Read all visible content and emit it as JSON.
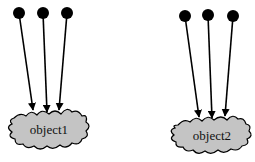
{
  "diagram": {
    "colors": {
      "background": "#ffffff",
      "stroke": "#000000",
      "cloud_fill": "#c4c4c4"
    },
    "groups": [
      {
        "name": "group-1",
        "object_label": "object1",
        "sources": [
          {
            "cx": 19,
            "cy": 13
          },
          {
            "cx": 43,
            "cy": 13
          },
          {
            "cx": 67,
            "cy": 13
          }
        ],
        "arrow_tips": [
          {
            "x": 33,
            "y": 110
          },
          {
            "x": 47,
            "y": 112
          },
          {
            "x": 59,
            "y": 110
          }
        ]
      },
      {
        "name": "group-2",
        "object_label": "object2",
        "sources": [
          {
            "cx": 185,
            "cy": 16
          },
          {
            "cx": 208,
            "cy": 15
          },
          {
            "cx": 233,
            "cy": 16
          }
        ],
        "arrow_tips": [
          {
            "x": 199,
            "y": 117
          },
          {
            "x": 212,
            "y": 118
          },
          {
            "x": 225,
            "y": 116
          }
        ]
      }
    ]
  }
}
